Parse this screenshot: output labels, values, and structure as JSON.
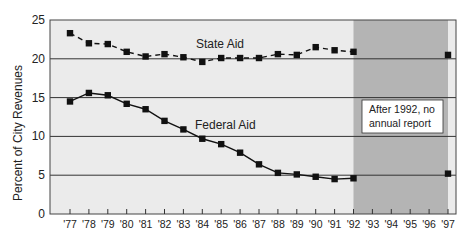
{
  "chart_data": {
    "type": "line",
    "title": "",
    "xlabel": "",
    "ylabel": "Percent of City Revenues",
    "ylim": [
      0,
      25
    ],
    "yticks": [
      0,
      5,
      10,
      15,
      20,
      25
    ],
    "grid": "horizontal",
    "categories": [
      "'77",
      "'78",
      "'79",
      "'80",
      "'81",
      "'82",
      "'83",
      "'84",
      "'85",
      "'86",
      "'87",
      "'88",
      "'89",
      "'90",
      "'91",
      "'92",
      "'93",
      "'94",
      "'95",
      "'96",
      "'97"
    ],
    "x": [
      1977,
      1978,
      1979,
      1980,
      1981,
      1982,
      1983,
      1984,
      1985,
      1986,
      1987,
      1988,
      1989,
      1990,
      1991,
      1992,
      1993,
      1994,
      1995,
      1996,
      1997
    ],
    "series": [
      {
        "name": "State Aid",
        "style": "dashed",
        "values": [
          23.3,
          22.0,
          21.9,
          20.9,
          20.3,
          20.6,
          20.2,
          19.6,
          20.1,
          20.1,
          20.1,
          20.6,
          20.5,
          21.5,
          21.1,
          20.9,
          null,
          null,
          null,
          null,
          20.5
        ]
      },
      {
        "name": "Federal Aid",
        "style": "solid",
        "values": [
          14.5,
          15.6,
          15.3,
          14.2,
          13.5,
          12.0,
          10.9,
          9.7,
          9.0,
          7.9,
          6.4,
          5.3,
          5.1,
          4.8,
          4.5,
          4.6,
          null,
          null,
          null,
          null,
          5.2
        ]
      }
    ],
    "shaded_region": {
      "from": 1992,
      "to": 1997,
      "color": "#b4b4b4"
    },
    "annotations": [
      {
        "text": "After 1992, no annual report",
        "lines": [
          "After 1992, no",
          "annual report"
        ]
      }
    ],
    "series_labels": {
      "state": "State Aid",
      "federal": "Federal Aid"
    }
  },
  "colors": {
    "plot_background": "#ebebeb",
    "shaded": "#b4b4b4",
    "line": "#111111",
    "grid": "#333333"
  }
}
